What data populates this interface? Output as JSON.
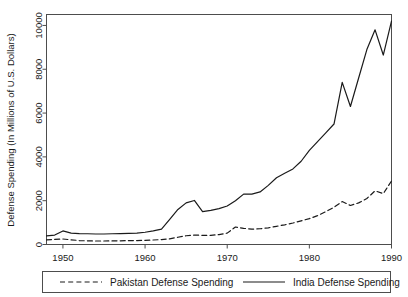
{
  "chart_data": {
    "type": "line",
    "title": "",
    "xlabel": "",
    "ylabel": "Defense Spending (In Millions of U.S. Dollars)",
    "xlim": [
      1948,
      1990
    ],
    "ylim": [
      0,
      10500
    ],
    "xticks": [
      1950,
      1960,
      1970,
      1980,
      1990
    ],
    "xticklabels": [
      "1950",
      "1960",
      "1970",
      "1980",
      "1990"
    ],
    "yticks": [
      0,
      2000,
      4000,
      6000,
      8000,
      10000
    ],
    "yticklabels": [
      "0",
      "2000",
      "4000",
      "6000",
      "8000",
      "10000"
    ],
    "grid": false,
    "legend_position": "below-axes",
    "x": [
      1948,
      1949,
      1950,
      1951,
      1952,
      1953,
      1954,
      1955,
      1956,
      1957,
      1958,
      1959,
      1960,
      1961,
      1962,
      1963,
      1964,
      1965,
      1966,
      1967,
      1968,
      1969,
      1970,
      1971,
      1972,
      1973,
      1974,
      1975,
      1976,
      1977,
      1978,
      1979,
      1980,
      1981,
      1982,
      1983,
      1984,
      1985,
      1986,
      1987,
      1988,
      1989,
      1990
    ],
    "series": [
      {
        "name": "India Defense Spending",
        "style": "solid",
        "color": "#1a1a1a",
        "values": [
          390,
          430,
          620,
          520,
          500,
          490,
          480,
          480,
          490,
          500,
          510,
          520,
          560,
          620,
          700,
          1150,
          1600,
          1900,
          2010,
          1500,
          1560,
          1640,
          1760,
          2000,
          2300,
          2300,
          2400,
          2700,
          3050,
          3250,
          3450,
          3800,
          4300,
          4700,
          5100,
          5500,
          7400,
          6300,
          7600,
          8900,
          9800,
          8650,
          10200
        ]
      },
      {
        "name": "Pakistan Defense Spending",
        "style": "dashed",
        "color": "#1a1a1a",
        "values": [
          210,
          230,
          250,
          215,
          180,
          165,
          160,
          160,
          165,
          170,
          175,
          180,
          190,
          205,
          225,
          260,
          330,
          400,
          430,
          420,
          420,
          450,
          520,
          800,
          740,
          700,
          720,
          760,
          830,
          900,
          980,
          1080,
          1180,
          1320,
          1500,
          1700,
          1960,
          1780,
          1900,
          2100,
          2450,
          2320,
          2900
        ]
      }
    ]
  },
  "legend": {
    "items": [
      {
        "label": "Pakistan Defense Spending",
        "style": "dashed"
      },
      {
        "label": "India Defense Spending",
        "style": "solid"
      }
    ]
  }
}
